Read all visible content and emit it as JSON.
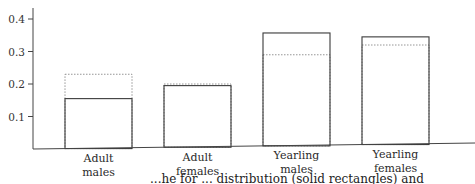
{
  "chart_data": {
    "type": "bar",
    "title": "",
    "xlabel": "",
    "ylabel": "",
    "ylim": [
      0,
      0.42
    ],
    "yticks": [
      0.1,
      0.2,
      0.3,
      0.4
    ],
    "ytick_labels": [
      "0.1",
      "0.2",
      "0.3",
      "0.4"
    ],
    "grid": false,
    "categories": [
      "Adult males",
      "Adult females",
      "Yearling males",
      "Yearling females"
    ],
    "category_lines": [
      [
        "Adult",
        "males"
      ],
      [
        "Adult",
        "females"
      ],
      [
        "Yearling",
        "males"
      ],
      [
        "Yearling",
        "females"
      ]
    ],
    "series": [
      {
        "name": "solid rectangles",
        "style": "solid",
        "values": [
          0.155,
          0.195,
          0.357,
          0.345
        ]
      },
      {
        "name": "dotted rectangles",
        "style": "dotted",
        "values": [
          0.23,
          0.2,
          0.29,
          0.32
        ]
      }
    ]
  },
  "caption": {
    "visible_fragment": "...he for ... distribution (solid rectangles) and"
  },
  "colors": {
    "solid": "#3a3a3a",
    "dotted": "#8a8a8a",
    "axis": "#444444"
  }
}
